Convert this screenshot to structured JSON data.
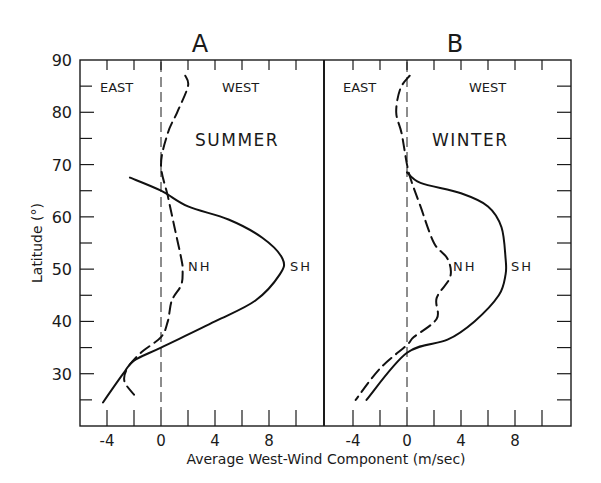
{
  "chart_data": {
    "type": "line",
    "xlabel": "Average West-Wind Component (m/sec)",
    "ylabel": "Latitude (°)",
    "ylim": [
      20,
      90
    ],
    "yticks": [
      30,
      40,
      50,
      60,
      70,
      80,
      90
    ],
    "grid": false,
    "panels": [
      {
        "id": "A",
        "title": "A",
        "season": "SUMMER",
        "region_labels": {
          "left": "EAST",
          "right": "WEST"
        },
        "xlim": [
          -6,
          12
        ],
        "xtick_labels": [
          "-4",
          "0",
          "4",
          "8"
        ],
        "series": [
          {
            "name": "SH",
            "style": "solid",
            "points": [
              [
                -2.3,
                67.5
              ],
              [
                0,
                65
              ],
              [
                2,
                62
              ],
              [
                5,
                59.5
              ],
              [
                7.5,
                56
              ],
              [
                9,
                52
              ],
              [
                8.8,
                49
              ],
              [
                7,
                44
              ],
              [
                4,
                40
              ],
              [
                0,
                35
              ],
              [
                -2,
                32.5
              ],
              [
                -2.8,
                30
              ],
              [
                -4.3,
                24.5
              ]
            ]
          },
          {
            "name": "NH",
            "style": "dashed",
            "points": [
              [
                1.8,
                87
              ],
              [
                2,
                85
              ],
              [
                1.2,
                80
              ],
              [
                0.5,
                76
              ],
              [
                0,
                70
              ],
              [
                0.5,
                64
              ],
              [
                1,
                58
              ],
              [
                1.5,
                52
              ],
              [
                1.6,
                50
              ],
              [
                1.5,
                47
              ],
              [
                0.8,
                44
              ],
              [
                0.5,
                40
              ],
              [
                0,
                37
              ],
              [
                -1.5,
                34
              ],
              [
                -2.5,
                31
              ],
              [
                -2.7,
                28.5
              ],
              [
                -2,
                26
              ]
            ]
          }
        ],
        "annotations": [
          {
            "text": "NH",
            "x": 1.9,
            "y": 51
          },
          {
            "text": "SH",
            "x": 9.5,
            "y": 51
          }
        ]
      },
      {
        "id": "B",
        "title": "B",
        "season": "WINTER",
        "region_labels": {
          "left": "EAST",
          "right": "WEST"
        },
        "xlim": [
          -6,
          12
        ],
        "xtick_labels": [
          "-4",
          "0",
          "4",
          "8"
        ],
        "series": [
          {
            "name": "SH",
            "style": "solid",
            "points": [
              [
                0,
                68.5
              ],
              [
                1,
                66.5
              ],
              [
                4,
                64.5
              ],
              [
                6,
                62
              ],
              [
                7,
                58
              ],
              [
                7.3,
                52
              ],
              [
                7.3,
                49
              ],
              [
                6.8,
                45
              ],
              [
                5,
                40
              ],
              [
                3,
                36.5
              ],
              [
                0,
                34
              ],
              [
                -3,
                25
              ]
            ]
          },
          {
            "name": "NH",
            "style": "dashed",
            "points": [
              [
                0.2,
                87
              ],
              [
                -0.5,
                84.5
              ],
              [
                -0.8,
                80
              ],
              [
                -0.4,
                76
              ],
              [
                0,
                70
              ],
              [
                0.3,
                67
              ],
              [
                1,
                62
              ],
              [
                2,
                55
              ],
              [
                3,
                52
              ],
              [
                3.2,
                48.5
              ],
              [
                2.2,
                44.5
              ],
              [
                2.2,
                40.5
              ],
              [
                0.5,
                37
              ],
              [
                0,
                35.5
              ],
              [
                -2,
                31
              ],
              [
                -3.8,
                25
              ]
            ]
          }
        ],
        "annotations": [
          {
            "text": "NH",
            "x": 3.4,
            "y": 51
          },
          {
            "text": "SH",
            "x": 7.8,
            "y": 51
          }
        ]
      }
    ]
  },
  "labels": {
    "panel_a_title": "A",
    "panel_b_title": "B",
    "panel_a_season": "SUMMER",
    "panel_b_season": "WINTER",
    "east": "EAST",
    "west": "WEST",
    "nh": "NH",
    "sh": "SH",
    "xlabel": "Average West-Wind Component (m/sec)",
    "ylabel": "Latitude (°)",
    "yticks": [
      "90",
      "80",
      "70",
      "60",
      "50",
      "40",
      "30"
    ],
    "xticks": [
      "-4",
      "0",
      "4",
      "8"
    ]
  }
}
